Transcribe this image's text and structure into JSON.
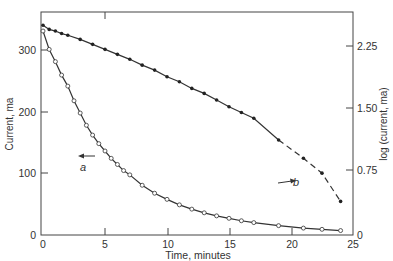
{
  "chart_data": {
    "type": "scatter",
    "title": "",
    "xlabel": "Time, minutes",
    "ylabel": "Current, ma",
    "ylabel_right": "log (current, ma)",
    "xlim": [
      0,
      25
    ],
    "ylim": [
      0,
      360
    ],
    "ylim_right": [
      0,
      2.6
    ],
    "x_ticks": [
      "0",
      "5",
      "10",
      "15",
      "20",
      "25"
    ],
    "y_ticks": [
      "0",
      "100",
      "200",
      "300"
    ],
    "y_ticks_right": [
      "0",
      "0.75",
      "1.50",
      "2.25"
    ],
    "grid": false,
    "series": [
      {
        "name": "a",
        "axis": "left",
        "marker": "open-circle",
        "label": "a",
        "x": [
          0,
          0.5,
          1,
          1.5,
          2,
          2.5,
          3,
          3.5,
          4,
          4.5,
          5,
          5.5,
          6,
          6.5,
          7,
          8,
          9,
          10,
          11,
          12,
          13,
          14,
          15,
          16,
          17,
          19,
          21,
          22.5,
          24
        ],
        "values": [
          330,
          300,
          280,
          258,
          240,
          216,
          196,
          176,
          160,
          146,
          134,
          122,
          112,
          102,
          95,
          78,
          65,
          55,
          46,
          39,
          33,
          28,
          24,
          20,
          17,
          12,
          8,
          6,
          4
        ]
      },
      {
        "name": "b",
        "axis": "right",
        "marker": "filled-circle",
        "label": "b",
        "x": [
          0,
          0.5,
          1,
          1.5,
          2,
          3,
          4,
          5,
          6,
          7,
          8,
          9,
          10,
          11,
          12,
          13,
          14,
          15,
          16,
          17,
          19,
          21,
          22.5,
          24
        ],
        "values": [
          2.5,
          2.45,
          2.43,
          2.4,
          2.38,
          2.33,
          2.27,
          2.21,
          2.15,
          2.09,
          2.02,
          1.96,
          1.88,
          1.82,
          1.74,
          1.68,
          1.6,
          1.52,
          1.45,
          1.38,
          1.12,
          0.9,
          0.72,
          0.38
        ]
      }
    ],
    "annotations": [
      {
        "text": "a",
        "arrow": "left",
        "note": "curve a reads on left axis"
      },
      {
        "text": "b",
        "arrow": "right",
        "note": "curve b reads on right axis"
      }
    ]
  },
  "labels": {
    "xlabel": "Time, minutes",
    "ylabel": "Current, ma",
    "ylabel_right": "log (current, ma)",
    "a": "a",
    "b": "b",
    "xt0": "0",
    "xt5": "5",
    "xt10": "10",
    "xt15": "15",
    "xt20": "20",
    "xt25": "25",
    "yl0": "0",
    "yl100": "100",
    "yl200": "200",
    "yl300": "300",
    "yr0": "0",
    "yr075": "0.75",
    "yr150": "1.50",
    "yr225": "2.25"
  }
}
